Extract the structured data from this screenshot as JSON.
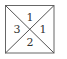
{
  "diagram": {
    "shape": "square with both diagonals",
    "stroke_color": "#555555",
    "regions": [
      {
        "position": "top",
        "label": "1"
      },
      {
        "position": "right",
        "label": "1"
      },
      {
        "position": "bottom",
        "label": "2"
      },
      {
        "position": "left",
        "label": "3"
      }
    ]
  }
}
